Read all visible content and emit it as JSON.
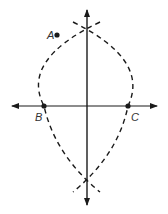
{
  "diagram": {
    "type": "perpendicular-bisector-construction",
    "points": [
      {
        "id": "A",
        "label": "A",
        "x": 57,
        "y": 35,
        "label_x": 47,
        "label_y": 39
      },
      {
        "id": "B",
        "label": "B",
        "x": 44,
        "y": 106,
        "label_x": 35,
        "label_y": 121
      },
      {
        "id": "C",
        "label": "C",
        "x": 128,
        "y": 106,
        "label_x": 131,
        "label_y": 121
      }
    ],
    "lines": {
      "horizontal": {
        "x1": 12,
        "y1": 106,
        "x2": 157,
        "y2": 106,
        "arrows": "both"
      },
      "vertical": {
        "x1": 87,
        "y1": 10,
        "x2": 87,
        "y2": 205,
        "arrows": "both"
      }
    },
    "arcs": {
      "style": "dashed",
      "intersections": [
        {
          "x": 87,
          "y": 33
        },
        {
          "x": 87,
          "y": 182
        }
      ]
    },
    "colors": {
      "stroke": "#1a1a1a",
      "background": "#ffffff",
      "label": "#333333"
    }
  }
}
